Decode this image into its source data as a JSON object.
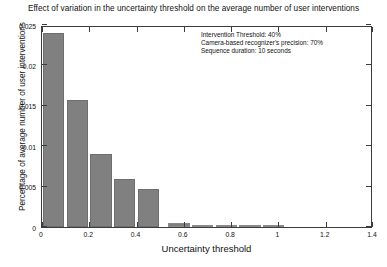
{
  "chart_data": {
    "type": "bar",
    "title": "Effect of variation in the uncertainty threshold on the average number of user interventions",
    "xlabel": "Uncertainty threshold",
    "ylabel": "Percentage of average number of user interventions",
    "xlim": [
      0,
      1.4
    ],
    "ylim": [
      0,
      0.025
    ],
    "grid": false,
    "legend": null,
    "bar_color": "#808080",
    "xticks": [
      0,
      0.2,
      0.4,
      0.6,
      0.8,
      1,
      1.2,
      1.4
    ],
    "xtick_labels": [
      "0",
      "0.2",
      "0.4",
      "0.6",
      "0.8",
      "1",
      "1.2",
      "1.4"
    ],
    "yticks": [
      0,
      0.005,
      0.01,
      0.015,
      0.02,
      0.025
    ],
    "ytick_labels": [
      "0",
      "0.005",
      "0.01",
      "0.015",
      "0.02",
      "0.025"
    ],
    "bar_width": 0.09,
    "x": [
      0.05,
      0.15,
      0.25,
      0.35,
      0.45,
      0.58,
      0.68,
      0.78,
      0.88,
      0.98
    ],
    "values": [
      0.024,
      0.0157,
      0.009,
      0.006,
      0.0047,
      0.00055,
      0.0003,
      0.00022,
      0.00018,
      0.00015
    ],
    "annotations": [
      "Intervention Threshold: 40%",
      "Camera-based recognizer's precision: 70%",
      "Sequence duration: 10 seconds"
    ]
  }
}
